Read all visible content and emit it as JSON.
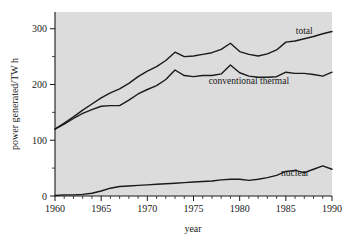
{
  "chart_data": {
    "type": "line",
    "title": "",
    "xlabel": "year",
    "ylabel": "power generated/TW h",
    "xlim": [
      1960,
      1990
    ],
    "ylim": [
      0,
      330
    ],
    "xticks": [
      1960,
      1965,
      1970,
      1975,
      1980,
      1985,
      1990
    ],
    "xtick_labels": [
      "1960",
      "1965",
      "1970",
      "1975",
      "1980",
      "1985",
      "1990"
    ],
    "yticks": [
      0,
      100,
      200,
      300
    ],
    "ytick_labels": [
      "0",
      "100",
      "200",
      "300"
    ],
    "minor_x_tick_step": 1,
    "minor_y_tick_step": 50,
    "grid": false,
    "legend_position": "inline-annotations",
    "x": [
      1960,
      1961,
      1962,
      1963,
      1964,
      1965,
      1966,
      1967,
      1968,
      1969,
      1970,
      1971,
      1972,
      1973,
      1974,
      1975,
      1976,
      1977,
      1978,
      1979,
      1980,
      1981,
      1982,
      1983,
      1984,
      1985,
      1986,
      1987,
      1988,
      1989,
      1990
    ],
    "series": [
      {
        "name": "total",
        "label": "total",
        "values": [
          120,
          131,
          142,
          154,
          165,
          176,
          185,
          192,
          202,
          214,
          224,
          232,
          243,
          258,
          250,
          251,
          254,
          257,
          263,
          274,
          259,
          254,
          251,
          255,
          262,
          276,
          278,
          282,
          286,
          291,
          295
        ]
      },
      {
        "name": "conventional thermal",
        "label": "conventional thermal",
        "values": [
          120,
          129,
          139,
          148,
          155,
          161,
          162,
          162,
          172,
          183,
          191,
          198,
          209,
          226,
          216,
          214,
          216,
          216,
          219,
          235,
          221,
          215,
          213,
          213,
          214,
          222,
          220,
          220,
          218,
          215,
          222
        ]
      },
      {
        "name": "nuclear",
        "label": "nuclear",
        "values": [
          1,
          2,
          2,
          3,
          5,
          9,
          14,
          17,
          18,
          19,
          20,
          21,
          22,
          23,
          24,
          25,
          26,
          27,
          29,
          30,
          30,
          28,
          30,
          33,
          37,
          44,
          46,
          42,
          48,
          54,
          48
        ]
      }
    ],
    "annotations": [
      {
        "text": "total",
        "x": 1987,
        "y": 290
      },
      {
        "text": "conventional thermal",
        "x": 1981,
        "y": 200
      },
      {
        "text": "nuclear",
        "x": 1986,
        "y": 36
      }
    ]
  },
  "axes": {
    "y_axis_title": "power generated/TW h",
    "x_axis_title": "year"
  },
  "colors": {
    "plot_background": "#dcdcdc",
    "line": "#1a1a1a",
    "text": "#1a1a1a",
    "page_background": "#ffffff"
  }
}
